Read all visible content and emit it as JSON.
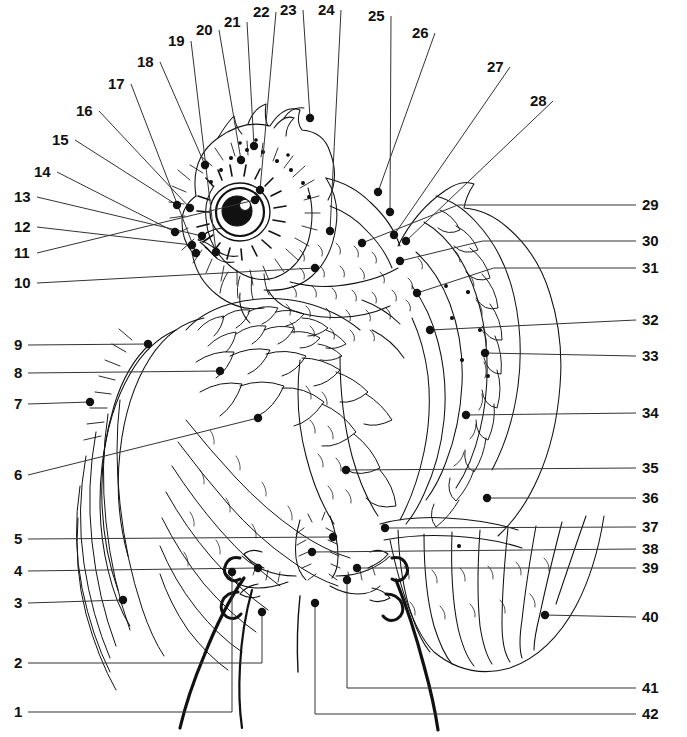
{
  "figure": {
    "style": "pen-and-ink line drawing",
    "background_color": "#ffffff",
    "ink_color": "#111111",
    "leader_color": "#333333",
    "label_count": 42
  },
  "labels": [
    {
      "n": "1",
      "side": "left",
      "x": 14,
      "y": 712,
      "tip_x": 232,
      "tip_y": 572,
      "route": "elbow"
    },
    {
      "n": "2",
      "side": "left",
      "x": 14,
      "y": 663,
      "tip_x": 262,
      "tip_y": 612,
      "route": "elbow"
    },
    {
      "n": "3",
      "side": "left",
      "x": 14,
      "y": 603,
      "tip_x": 123,
      "tip_y": 600,
      "route": "straight"
    },
    {
      "n": "4",
      "side": "left",
      "x": 14,
      "y": 571,
      "tip_x": 258,
      "tip_y": 568,
      "route": "straight"
    },
    {
      "n": "5",
      "side": "left",
      "x": 14,
      "y": 539,
      "tip_x": 333,
      "tip_y": 537,
      "route": "straight"
    },
    {
      "n": "6",
      "side": "left",
      "x": 14,
      "y": 475,
      "tip_x": 258,
      "tip_y": 418,
      "route": "straight"
    },
    {
      "n": "7",
      "side": "left",
      "x": 14,
      "y": 404,
      "tip_x": 90,
      "tip_y": 402,
      "route": "straight"
    },
    {
      "n": "8",
      "side": "left",
      "x": 14,
      "y": 373,
      "tip_x": 220,
      "tip_y": 371,
      "route": "straight"
    },
    {
      "n": "9",
      "side": "left",
      "x": 14,
      "y": 345,
      "tip_x": 148,
      "tip_y": 344,
      "route": "straight"
    },
    {
      "n": "10",
      "side": "left",
      "x": 14,
      "y": 283,
      "tip_x": 315,
      "tip_y": 268,
      "route": "straight"
    },
    {
      "n": "11",
      "side": "left",
      "x": 14,
      "y": 253,
      "tip_x": 255,
      "tip_y": 200,
      "route": "straight"
    },
    {
      "n": "12",
      "side": "left",
      "x": 14,
      "y": 227,
      "tip_x": 192,
      "tip_y": 245,
      "route": "straight"
    },
    {
      "n": "13",
      "side": "left",
      "x": 14,
      "y": 197,
      "tip_x": 202,
      "tip_y": 236,
      "route": "straight"
    },
    {
      "n": "14",
      "side": "left",
      "x": 34,
      "y": 172,
      "tip_x": 175,
      "tip_y": 232,
      "route": "straight"
    },
    {
      "n": "15",
      "side": "left",
      "x": 52,
      "y": 140,
      "tip_x": 177,
      "tip_y": 205,
      "route": "straight"
    },
    {
      "n": "16",
      "side": "left",
      "x": 76,
      "y": 111,
      "tip_x": 190,
      "tip_y": 208,
      "route": "straight"
    },
    {
      "n": "17",
      "side": "left",
      "x": 108,
      "y": 84,
      "tip_x": 196,
      "tip_y": 253,
      "route": "straight"
    },
    {
      "n": "18",
      "side": "left",
      "x": 137,
      "y": 62,
      "tip_x": 205,
      "tip_y": 165,
      "route": "straight"
    },
    {
      "n": "19",
      "side": "left",
      "x": 168,
      "y": 41,
      "tip_x": 216,
      "tip_y": 252,
      "route": "straight"
    },
    {
      "n": "20",
      "side": "left",
      "x": 196,
      "y": 30,
      "tip_x": 241,
      "tip_y": 160,
      "route": "straight"
    },
    {
      "n": "21",
      "side": "left",
      "x": 224,
      "y": 22,
      "tip_x": 254,
      "tip_y": 146,
      "route": "straight"
    },
    {
      "n": "22",
      "side": "left",
      "x": 253,
      "y": 12,
      "tip_x": 260,
      "tip_y": 190,
      "route": "straight"
    },
    {
      "n": "23",
      "side": "left",
      "x": 280,
      "y": 10,
      "tip_x": 310,
      "tip_y": 118,
      "route": "straight"
    },
    {
      "n": "24",
      "side": "left",
      "x": 318,
      "y": 10,
      "tip_x": 330,
      "tip_y": 231,
      "route": "straight"
    },
    {
      "n": "25",
      "side": "left",
      "x": 368,
      "y": 16,
      "tip_x": 390,
      "tip_y": 212,
      "route": "straight"
    },
    {
      "n": "26",
      "side": "left",
      "x": 412,
      "y": 33,
      "tip_x": 378,
      "tip_y": 192,
      "route": "straight"
    },
    {
      "n": "27",
      "side": "left",
      "x": 487,
      "y": 67,
      "tip_x": 394,
      "tip_y": 235,
      "route": "straight"
    },
    {
      "n": "28",
      "side": "left",
      "x": 530,
      "y": 101,
      "tip_x": 406,
      "tip_y": 241,
      "route": "straight"
    },
    {
      "n": "29",
      "side": "right",
      "x": 642,
      "y": 205,
      "tip_x": 362,
      "tip_y": 243,
      "route": "dogleg"
    },
    {
      "n": "30",
      "side": "right",
      "x": 642,
      "y": 241,
      "tip_x": 400,
      "tip_y": 261,
      "route": "dogleg"
    },
    {
      "n": "31",
      "side": "right",
      "x": 642,
      "y": 268,
      "tip_x": 417,
      "tip_y": 293,
      "route": "dogleg"
    },
    {
      "n": "32",
      "side": "right",
      "x": 642,
      "y": 320,
      "tip_x": 430,
      "tip_y": 330,
      "route": "straight"
    },
    {
      "n": "33",
      "side": "right",
      "x": 642,
      "y": 356,
      "tip_x": 485,
      "tip_y": 353,
      "route": "straight"
    },
    {
      "n": "34",
      "side": "right",
      "x": 642,
      "y": 413,
      "tip_x": 466,
      "tip_y": 415,
      "route": "straight"
    },
    {
      "n": "35",
      "side": "right",
      "x": 642,
      "y": 468,
      "tip_x": 346,
      "tip_y": 470,
      "route": "straight"
    },
    {
      "n": "36",
      "side": "right",
      "x": 642,
      "y": 498,
      "tip_x": 487,
      "tip_y": 498,
      "route": "straight"
    },
    {
      "n": "37",
      "side": "right",
      "x": 642,
      "y": 527,
      "tip_x": 385,
      "tip_y": 528,
      "route": "straight"
    },
    {
      "n": "38",
      "side": "right",
      "x": 642,
      "y": 549,
      "tip_x": 312,
      "tip_y": 552,
      "route": "straight"
    },
    {
      "n": "39",
      "side": "right",
      "x": 642,
      "y": 568,
      "tip_x": 357,
      "tip_y": 568,
      "route": "straight"
    },
    {
      "n": "40",
      "side": "right",
      "x": 642,
      "y": 617,
      "tip_x": 545,
      "tip_y": 615,
      "route": "straight"
    },
    {
      "n": "41",
      "side": "right",
      "x": 642,
      "y": 688,
      "tip_x": 347,
      "tip_y": 580,
      "route": "elbow"
    },
    {
      "n": "42",
      "side": "right",
      "x": 642,
      "y": 714,
      "tip_x": 315,
      "tip_y": 603,
      "route": "elbow"
    }
  ]
}
